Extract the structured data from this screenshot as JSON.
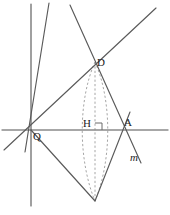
{
  "figure": {
    "background_color": "#ffffff",
    "stroke_color": "#5a5a5a",
    "dash_color": "#9a9a9a",
    "label_color": "#1c1c1c",
    "width": 170,
    "height": 215,
    "labels": {
      "D": "D",
      "O": "Q",
      "H": "H",
      "A": "A",
      "m": "m"
    },
    "points": {
      "D": {
        "x": 95,
        "y": 62
      },
      "O": {
        "x": 31,
        "y": 130
      },
      "H": {
        "x": 95,
        "y": 130
      },
      "A": {
        "x": 125,
        "y": 130
      },
      "B": {
        "x": 95,
        "y": 201
      }
    },
    "right_angle_marker": {
      "x": 95,
      "y": 130,
      "size": 7,
      "at": "H"
    },
    "lines": [
      {
        "name": "horizontal-axis",
        "x1": 2,
        "y1": 130,
        "x2": 168,
        "y2": 130,
        "style": "solid"
      },
      {
        "name": "vertical-line",
        "x1": 31,
        "y1": 4,
        "x2": 31,
        "y2": 206,
        "style": "solid"
      },
      {
        "name": "steep-line-through-O",
        "x1": 49,
        "y1": 3,
        "x2": 25,
        "y2": 152,
        "style": "solid"
      },
      {
        "name": "line-O-to-D-extended",
        "x1": 4,
        "y1": 150,
        "x2": 156,
        "y2": 8,
        "style": "solid"
      },
      {
        "name": "line-m-through-D-and-A",
        "x1": 70,
        "y1": 5,
        "x2": 141,
        "y2": 163,
        "style": "solid"
      },
      {
        "name": "segment-O-to-B",
        "x1": 31,
        "y1": 130,
        "x2": 95,
        "y2": 201,
        "style": "solid"
      },
      {
        "name": "segment-B-to-A-extended",
        "x1": 95,
        "y1": 201,
        "x2": 130,
        "y2": 112,
        "style": "solid"
      }
    ],
    "dashed": [
      {
        "name": "lens-left-arc",
        "type": "arc",
        "from": "D",
        "to": "B",
        "bulge_x": 81
      },
      {
        "name": "lens-right-arc",
        "type": "arc",
        "from": "D",
        "to": "B",
        "bulge_x": 109
      },
      {
        "name": "lens-axis",
        "type": "line",
        "from": "D",
        "to": "B"
      }
    ]
  }
}
